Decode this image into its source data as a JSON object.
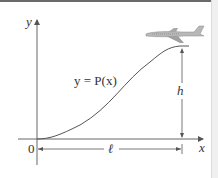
{
  "diagram": {
    "y_axis_label": "y",
    "x_axis_label": "x",
    "origin_label": "0",
    "curve_label": "y = P(x)",
    "height_label": "h",
    "length_label": "ℓ",
    "icon": "airplane-icon"
  }
}
